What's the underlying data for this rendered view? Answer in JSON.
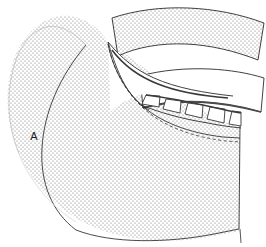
{
  "figure": {
    "domain": "Diagram",
    "kind": "technical-line-art-cross-section",
    "width": 266,
    "height": 247,
    "background_color": "#ffffff",
    "line_color": "#2b2b2b",
    "stipple_color": "#6e6e6e",
    "labels": [
      {
        "id": "label-a",
        "text": "A",
        "x": 34,
        "y": 140,
        "target": "large-stippled-body"
      }
    ],
    "regions": [
      {
        "id": "large-stippled-body",
        "name": "Large stippled curved body",
        "fill": "stipple",
        "label": "A"
      },
      {
        "id": "upper-stippled-band",
        "name": "Upper curved stippled band",
        "fill": "stipple",
        "label": ""
      },
      {
        "id": "middle-white-band",
        "name": "Middle curved unfilled band",
        "fill": "white",
        "label": ""
      },
      {
        "id": "tapered-blade",
        "name": "Thin tapered blade edge",
        "fill": "white",
        "label": ""
      }
    ],
    "teeth": {
      "name": "Trapezoidal standoff teeth",
      "count": 5,
      "fill": "white"
    }
  }
}
